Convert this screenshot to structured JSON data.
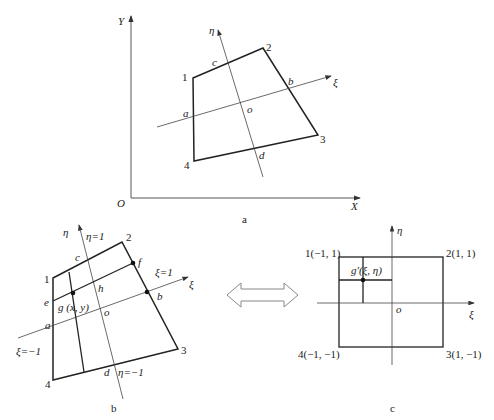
{
  "figure_a": {
    "caption": "a",
    "axes": {
      "x_label": "X",
      "y_label": "Y",
      "origin_label": "O"
    },
    "nodes": [
      "1",
      "2",
      "3",
      "4"
    ],
    "local_axes": {
      "xi": "ξ",
      "eta": "η"
    },
    "points": {
      "a": "a",
      "b": "b",
      "c": "c",
      "d": "d",
      "o": "o"
    }
  },
  "figure_b": {
    "caption": "b",
    "nodes": [
      "1",
      "2",
      "3",
      "4"
    ],
    "local_axes": {
      "xi": "ξ",
      "eta": "η"
    },
    "points": {
      "a": "a",
      "b": "b",
      "c": "c",
      "d": "d",
      "o": "o",
      "e": "e",
      "f": "f",
      "h": "h",
      "g": "g (x, y)"
    },
    "iso_labels": {
      "eta_pos": "η=1",
      "eta_neg": "η=−1",
      "xi_pos": "ξ=1",
      "xi_neg": "ξ=−1"
    }
  },
  "figure_c": {
    "caption": "c",
    "nodes": [
      "1(−1, 1)",
      "2(1, 1)",
      "3(1, −1)",
      "4(−1, −1)"
    ],
    "local_axes": {
      "xi": "ξ",
      "eta": "η"
    },
    "points": {
      "o": "o",
      "g": "g′(ξ, η)"
    }
  },
  "mapping_arrow": "double-arrow",
  "colors": {
    "line": "#222222",
    "axis": "#555555",
    "arrow_outline": "#888888"
  }
}
